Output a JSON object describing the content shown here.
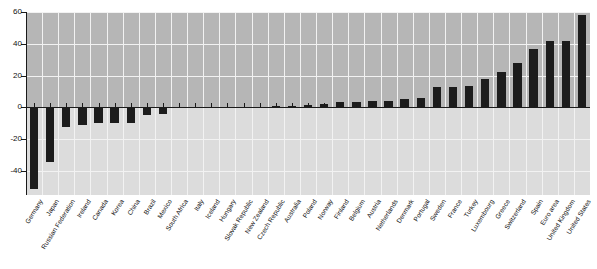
{
  "chart_data": {
    "type": "bar",
    "title": "",
    "subtitle": "",
    "xlabel": "",
    "ylabel": "",
    "ylim": [
      -55,
      60
    ],
    "yticks": [
      60,
      40,
      20,
      0,
      -20,
      -40
    ],
    "ytick_labels": [
      "60",
      "40",
      "20",
      "0",
      "-20",
      "-40"
    ],
    "grid": true,
    "legend": false,
    "bar_color": "#1c1c1c",
    "plot_bg_upper": "#b6b6b6",
    "plot_bg_lower": "#dcdcdc",
    "gridline_color": "#f2f2f2",
    "categories": [
      "Germany",
      "Japan",
      "Russian Federation",
      "Ireland",
      "Canada",
      "Korea",
      "China",
      "Brazil",
      "Mexico",
      "South Africa",
      "Italy",
      "Iceland",
      "Hungary",
      "Slovak Republic",
      "New Zealand",
      "Czech Republic",
      "Australia",
      "Poland",
      "Norway",
      "Finland",
      "Belgium",
      "Austria",
      "Netherlands",
      "Denmark",
      "Portugal",
      "Sweden",
      "France",
      "Turkey",
      "Luxembourg",
      "Greece",
      "Switzerland",
      "Spain",
      "Euro area",
      "United Kingdom",
      "United States"
    ],
    "values": [
      -51,
      -34,
      -12,
      -11,
      -10,
      -10,
      -10,
      -5,
      -4,
      -0.6,
      -0.2,
      0,
      0,
      0.3,
      0.5,
      0.8,
      1.2,
      1.7,
      2.4,
      3.6,
      3.7,
      4,
      4.2,
      5.6,
      6,
      13,
      13,
      13.8,
      18,
      22,
      28,
      36.5,
      41.5,
      41.5,
      58
    ]
  }
}
